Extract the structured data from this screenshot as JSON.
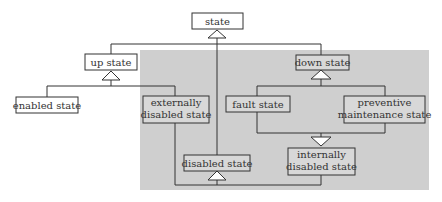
{
  "diagram": {
    "type": "class-hierarchy",
    "colors": {
      "background": "#ffffff",
      "region_fill": "#cfcfcf",
      "box_fill": "#ffffff",
      "shaded_box_fill": "#d8d8d8",
      "stroke": "#333333",
      "text": "#333333"
    },
    "nodes": {
      "state": {
        "lines": [
          "state"
        ]
      },
      "up_state": {
        "lines": [
          "up state"
        ]
      },
      "enabled_state": {
        "lines": [
          "enabled state"
        ]
      },
      "externally_disabled_state": {
        "lines": [
          "externally",
          "disabled state"
        ]
      },
      "disabled_state": {
        "lines": [
          "disabled state"
        ]
      },
      "down_state": {
        "lines": [
          "down state"
        ]
      },
      "fault_state": {
        "lines": [
          "fault state"
        ]
      },
      "preventive_maintenance_state": {
        "lines": [
          "preventive",
          "maintenance state"
        ]
      },
      "internally_disabled_state": {
        "lines": [
          "internally",
          "disabled state"
        ]
      }
    },
    "generalizations": [
      {
        "parent": "state",
        "children": [
          "up_state",
          "down_state",
          "disabled_state"
        ]
      },
      {
        "parent": "up_state",
        "children": [
          "enabled_state",
          "externally_disabled_state"
        ]
      },
      {
        "parent": "down_state",
        "children": [
          "fault_state",
          "preventive_maintenance_state"
        ]
      },
      {
        "parent": "internally_disabled_state",
        "children": [
          "fault_state",
          "preventive_maintenance_state"
        ]
      },
      {
        "parent": "disabled_state",
        "children": [
          "externally_disabled_state",
          "internally_disabled_state"
        ]
      }
    ],
    "shaded_region_members": [
      "externally_disabled_state",
      "disabled_state",
      "down_state",
      "fault_state",
      "preventive_maintenance_state",
      "internally_disabled_state"
    ]
  }
}
